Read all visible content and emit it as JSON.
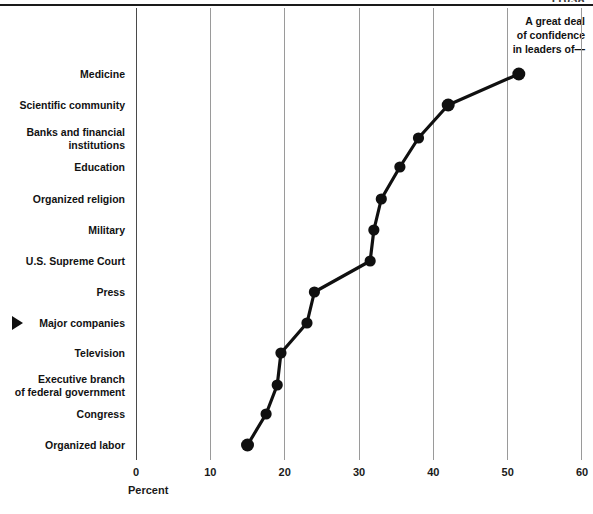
{
  "figure": {
    "tag": "11038",
    "header_label": "A great deal\nof confidence\nin leaders of—"
  },
  "axis": {
    "xlabel": "Percent",
    "ticks": [
      "0",
      "10",
      "20",
      "30",
      "40",
      "50",
      "60"
    ]
  },
  "pointer": {
    "icon": "triangle-right-marker",
    "points_at": "Major companies"
  },
  "chart_data": {
    "type": "line",
    "title": "A great deal of confidence in leaders of—",
    "xlabel": "Percent",
    "ylabel": "",
    "xlim": [
      0,
      60
    ],
    "grid": true,
    "legend": "none",
    "orientation": "categories-on-y",
    "categories": [
      "Medicine",
      "Scientific community",
      "Banks and financial\ninstitutions",
      "Education",
      "Organized religion",
      "Military",
      "U.S. Supreme  Court",
      "Press",
      "Major companies",
      "Television",
      "Executive  branch\nof federal government",
      "Congress",
      "Organized labor"
    ],
    "values": [
      51.5,
      42,
      38,
      35.5,
      33,
      32,
      31.5,
      24,
      23,
      19.5,
      19,
      17.5,
      15
    ],
    "marker": "filled-circle",
    "marker_color": "#101010",
    "line_color": "#101010"
  }
}
